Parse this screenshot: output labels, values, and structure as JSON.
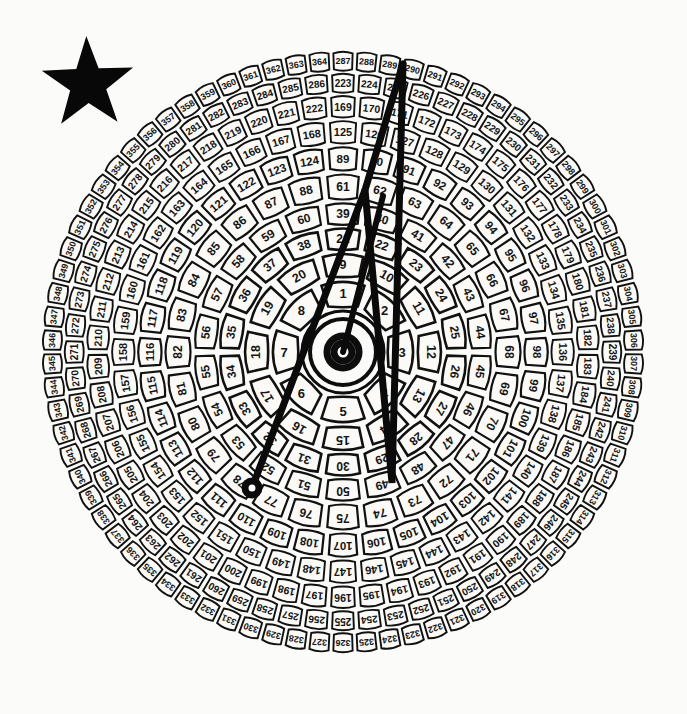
{
  "figure": {
    "kind": "radial-numbered-dial",
    "background_color": "#fbfbf9",
    "ink_color": "#111111",
    "cell_fill_color": "#fbfaf7",
    "width": 687,
    "height": 714
  },
  "star_marker": {
    "name": "black-five-pointed-star",
    "color": "#080808",
    "center_x": 88,
    "center_y": 84,
    "outer_radius": 48,
    "inner_radius": 19,
    "rotation_deg": -2
  },
  "dial": {
    "center_x": 343,
    "center_y": 352,
    "outer_radius": 302,
    "angle_start_deg": -90,
    "hub": {
      "circles": [
        {
          "r": 41,
          "stroke_width": 3
        },
        {
          "r": 33,
          "stroke_width": 4
        },
        {
          "r": 16,
          "stroke_width": 7
        }
      ],
      "core_radius": 9
    },
    "rings": [
      {
        "index": 1,
        "first": 1,
        "last": 8,
        "count": 8,
        "r_inner": 44,
        "r_outer": 74,
        "font_size": 13
      },
      {
        "index": 2,
        "first": 9,
        "last": 20,
        "count": 12,
        "r_inner": 74,
        "r_outer": 101,
        "font_size": 12.5
      },
      {
        "index": 3,
        "first": 21,
        "last": 38,
        "count": 18,
        "r_inner": 101,
        "r_outer": 126,
        "font_size": 12
      },
      {
        "index": 4,
        "first": 39,
        "last": 60,
        "count": 22,
        "r_inner": 126,
        "r_outer": 151,
        "font_size": 12
      },
      {
        "index": 5,
        "first": 61,
        "last": 88,
        "count": 28,
        "r_inner": 151,
        "r_outer": 180,
        "font_size": 12
      },
      {
        "index": 6,
        "first": 89,
        "last": 124,
        "count": 36,
        "r_inner": 180,
        "r_outer": 207,
        "font_size": 11.5
      },
      {
        "index": 7,
        "first": 125,
        "last": 168,
        "count": 44,
        "r_inner": 207,
        "r_outer": 233,
        "font_size": 11
      },
      {
        "index": 8,
        "first": 169,
        "last": 222,
        "count": 54,
        "r_inner": 233,
        "r_outer": 258,
        "font_size": 10.5
      },
      {
        "index": 9,
        "first": 223,
        "last": 286,
        "count": 64,
        "r_inner": 258,
        "r_outer": 280,
        "font_size": 10
      },
      {
        "index": 10,
        "first": 287,
        "last": 364,
        "count": 78,
        "r_inner": 280,
        "r_outer": 302,
        "font_size": 9
      }
    ],
    "ring_notes": {
      "innermost_label_sequence": "1 through 8 clockwise from the needle axis",
      "outermost_highest_label": 441,
      "total_cells": 441
    }
  },
  "overlay": {
    "stroke_color": "#0a0a0a",
    "polyline_stroke_width": 7,
    "needle_stroke_width": 6,
    "needle": {
      "from_x": 343,
      "from_y": 352,
      "to_x": 383,
      "to_y": 196
    },
    "polyline_points": "252,488 365,190 392,483 403,64",
    "extra_segment": "365,190 403,64",
    "terminal_dot": {
      "x": 252,
      "y": 488,
      "r": 7
    }
  },
  "readout": {
    "dot_cell_label": "115",
    "top_vertex_cell_label": "83",
    "bottom_vertex_cell_label": "61",
    "needle_tip_cell_label": "47",
    "right_edge_cell_label": "320"
  }
}
